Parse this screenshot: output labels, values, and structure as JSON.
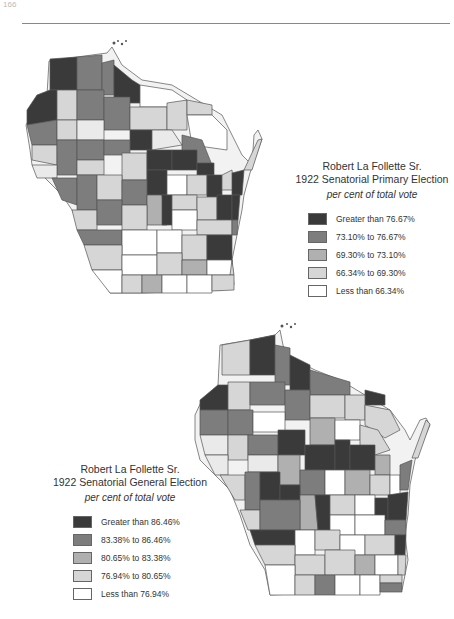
{
  "page": {
    "page_number": "166"
  },
  "maps": [
    {
      "id": "primary",
      "title_line1": "Robert La Follette Sr.",
      "title_line2": "1922 Senatorial Primary Election",
      "subtitle": "per cent of total vote",
      "legend": [
        {
          "label": "Greater than 76.67%",
          "color": "#3a3a3a"
        },
        {
          "label": "73.10% to 76.67%",
          "color": "#7d7d7d"
        },
        {
          "label": "69.30% to 73.10%",
          "color": "#b0b0b0"
        },
        {
          "label": "66.34% to 69.30%",
          "color": "#d6d6d6"
        },
        {
          "label": "Less than 66.34%",
          "color": "#ffffff"
        }
      ]
    },
    {
      "id": "general",
      "title_line1": "Robert La Follette Sr.",
      "title_line2": "1922 Senatorial General Election",
      "subtitle": "per cent of total vote",
      "legend": [
        {
          "label": "Greater than 86.46%",
          "color": "#3a3a3a"
        },
        {
          "label": "83.38% to 86.46%",
          "color": "#7d7d7d"
        },
        {
          "label": "80.65% to 83.38%",
          "color": "#b0b0b0"
        },
        {
          "label": "76.94% to 80.65%",
          "color": "#d6d6d6"
        },
        {
          "label": "Less than 76.94%",
          "color": "#ffffff"
        }
      ]
    }
  ]
}
